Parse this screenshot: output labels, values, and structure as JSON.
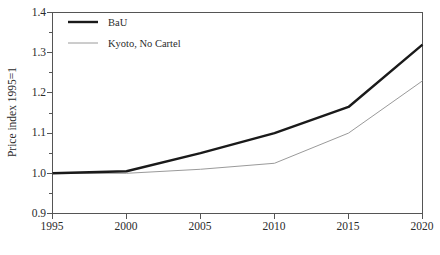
{
  "chart_data": {
    "type": "line",
    "title": "",
    "xlabel": "",
    "ylabel": "Price index 1995=1",
    "x": [
      1995,
      2000,
      2005,
      2010,
      2015,
      2020
    ],
    "xtick_labels": [
      "1995",
      "2000",
      "2005",
      "2010",
      "2015",
      "2020"
    ],
    "ytick_labels": [
      "0.9",
      "1.0",
      "1.1",
      "1.2",
      "1.3",
      "1.4"
    ],
    "ytick_values": [
      0.9,
      1.0,
      1.1,
      1.2,
      1.3,
      1.4
    ],
    "xlim": [
      1995,
      2020
    ],
    "ylim": [
      0.9,
      1.4
    ],
    "grid": false,
    "minor_ticks_y": [
      0.95,
      1.05,
      1.15,
      1.25,
      1.35
    ],
    "legend_position": "top-left",
    "series": [
      {
        "name": "BaU",
        "color": "#1a1a1a",
        "width": 2.4,
        "values": [
          1.0,
          1.005,
          1.05,
          1.1,
          1.165,
          1.32
        ]
      },
      {
        "name": "Kyoto, No Cartel",
        "color": "#9a9a9a",
        "width": 1.0,
        "values": [
          1.0,
          1.0,
          1.01,
          1.025,
          1.1,
          1.23
        ]
      }
    ]
  },
  "legend": {
    "items": [
      {
        "label": "BaU"
      },
      {
        "label": "Kyoto, No Cartel"
      }
    ]
  },
  "axes": {
    "y_title": "Price index 1995=1"
  },
  "colors": {
    "bau": "#1a1a1a",
    "kyoto": "#9a9a9a",
    "axis": "#555555",
    "text": "#2b2b2b",
    "background": "#ffffff"
  }
}
